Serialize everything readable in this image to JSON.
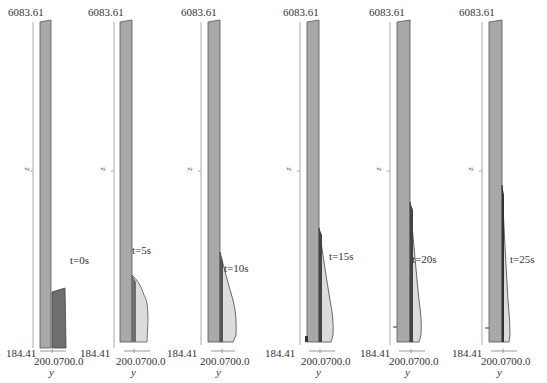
{
  "figure": {
    "panels": [
      {
        "t_label": "t=0s",
        "z_top": "6083.61",
        "z_bottom": "184.41",
        "y_ticks": "200.0700.0",
        "y_axis": "y",
        "z_axis": "z"
      },
      {
        "t_label": "t=5s",
        "z_top": "6083.61",
        "z_bottom": "184.41",
        "y_ticks": "200.0700.0",
        "y_axis": "y",
        "z_axis": "z"
      },
      {
        "t_label": "t=10s",
        "z_top": "6083.61",
        "z_bottom": "184.41",
        "y_ticks": "200.0700.0",
        "y_axis": "y",
        "z_axis": "z"
      },
      {
        "t_label": "t=15s",
        "z_top": "6083.61",
        "z_bottom": "184.41",
        "y_ticks": "200.0700.0",
        "y_axis": "y",
        "z_axis": "z"
      },
      {
        "t_label": "t=20s",
        "z_top": "6083.61",
        "z_bottom": "184.41",
        "y_ticks": "200.0700.0",
        "y_axis": "y",
        "z_axis": "z"
      },
      {
        "t_label": "t=25s",
        "z_top": "6083.61",
        "z_bottom": "184.41",
        "y_ticks": "200.0700.0",
        "y_axis": "y",
        "z_axis": "z"
      }
    ],
    "colors": {
      "column": "#a8a8a8",
      "column_edge": "#555555",
      "slump_dark": "#6e6e6e",
      "slump_light": "#dcdcdc",
      "axis": "#999999"
    }
  }
}
